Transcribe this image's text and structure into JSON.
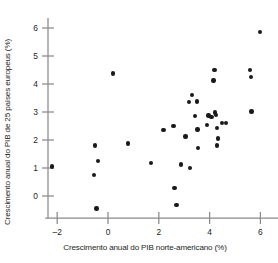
{
  "chart_data": {
    "type": "scatter",
    "title": "",
    "subtitle": "",
    "xlabel": "Crescimento anual do PIB norte-americano (%)",
    "ylabel": "Crescimento anual do PIB de 25 países europeus (%)",
    "xticks": [
      -2,
      0,
      2,
      4,
      6
    ],
    "xticklabels": [
      "–2",
      "0",
      "2",
      "4",
      "6"
    ],
    "yticks": [
      0,
      1,
      2,
      3,
      4,
      5,
      6
    ],
    "yticklabels": [
      "0",
      "1",
      "2",
      "3",
      "4",
      "5",
      "6"
    ],
    "xlim": [
      -2.9,
      7.9
    ],
    "ylim": [
      -0.85,
      6.45
    ],
    "grid": false,
    "legend": null,
    "marker_color": "#1a1a1a",
    "axis_color": "#8a8a8a",
    "points": [
      [
        -2.2,
        1.05
      ],
      [
        -0.52,
        1.8
      ],
      [
        -0.4,
        1.24
      ],
      [
        -0.55,
        0.75
      ],
      [
        -0.45,
        -0.45
      ],
      [
        0.2,
        4.37
      ],
      [
        0.78,
        1.88
      ],
      [
        1.7,
        1.18
      ],
      [
        2.18,
        2.35
      ],
      [
        2.58,
        2.5
      ],
      [
        2.62,
        0.29
      ],
      [
        2.7,
        -0.33
      ],
      [
        2.88,
        1.12
      ],
      [
        3.05,
        2.13
      ],
      [
        3.18,
        3.35
      ],
      [
        3.3,
        3.6
      ],
      [
        3.22,
        1.0
      ],
      [
        3.42,
        2.85
      ],
      [
        3.5,
        3.37
      ],
      [
        3.52,
        2.38
      ],
      [
        3.55,
        1.72
      ],
      [
        3.9,
        2.53
      ],
      [
        3.95,
        2.88
      ],
      [
        4.08,
        2.83
      ],
      [
        4.15,
        4.13
      ],
      [
        4.2,
        4.5
      ],
      [
        4.22,
        2.98
      ],
      [
        4.25,
        2.9
      ],
      [
        4.28,
        2.42
      ],
      [
        4.3,
        1.8
      ],
      [
        4.32,
        2.05
      ],
      [
        4.48,
        2.6
      ],
      [
        4.65,
        2.6
      ],
      [
        5.58,
        4.5
      ],
      [
        5.62,
        4.25
      ],
      [
        5.65,
        3.02
      ],
      [
        5.98,
        5.85
      ],
      [
        7.32,
        2.52
      ]
    ]
  }
}
